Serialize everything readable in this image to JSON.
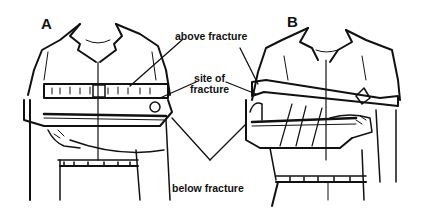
{
  "figure": {
    "panels": [
      {
        "id": "A",
        "label": "A"
      },
      {
        "id": "B",
        "label": "B"
      }
    ],
    "callouts": {
      "above": "above fracture",
      "site_line1": "site of",
      "site_line2": "fracture",
      "below": "below fracture"
    },
    "colors": {
      "ink": "#111111",
      "paper": "#ffffff"
    }
  }
}
